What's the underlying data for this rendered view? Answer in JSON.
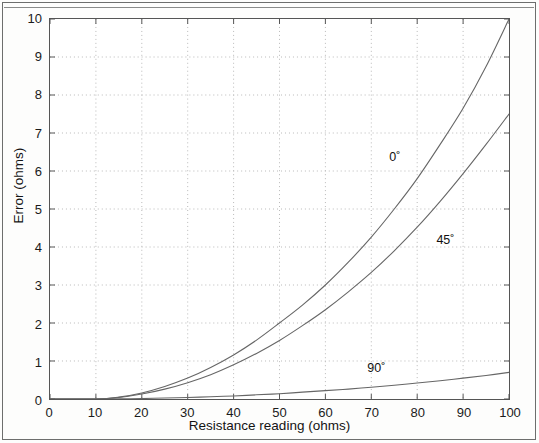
{
  "figure": {
    "xaxis_title": "Resistance reading (ohms)",
    "yaxis_title": "Error (ohms)"
  },
  "axes": {
    "y_ticks": [
      "10",
      "9",
      "8",
      "7",
      "6",
      "5",
      "4",
      "3",
      "2",
      "1",
      "0"
    ],
    "x_ticks": [
      "0",
      "10",
      "20",
      "30",
      "40",
      "50",
      "60",
      "70",
      "80",
      "90",
      "100"
    ]
  },
  "annotations": {
    "series0": "0˚",
    "series45": "45˚",
    "series90": "90˚"
  },
  "colors": {
    "curve": "#666666",
    "grid": "#b8b8b8",
    "axis": "#555555",
    "frame": "#6d6e6d",
    "text": "#141414",
    "background": "#ffffff"
  },
  "chart_data": {
    "type": "line",
    "title": "",
    "xlabel": "Resistance reading (ohms)",
    "ylabel": "Error (ohms)",
    "xlim": [
      0,
      100
    ],
    "ylim": [
      0,
      10
    ],
    "xticks": [
      0,
      10,
      20,
      30,
      40,
      50,
      60,
      70,
      80,
      90,
      100
    ],
    "yticks": [
      0,
      1,
      2,
      3,
      4,
      5,
      6,
      7,
      8,
      9,
      10
    ],
    "grid": true,
    "grid_style": "dotted",
    "legend": "inline-annotations",
    "x": [
      10,
      15,
      20,
      25,
      30,
      35,
      40,
      45,
      50,
      55,
      60,
      65,
      70,
      75,
      80,
      85,
      90,
      95,
      100
    ],
    "series": [
      {
        "name": "0˚",
        "label": "0˚",
        "label_x": 75,
        "label_y": 6.35,
        "values": [
          0,
          0.05,
          0.16,
          0.33,
          0.55,
          0.83,
          1.16,
          1.55,
          2.0,
          2.47,
          3.0,
          3.6,
          4.26,
          5.0,
          5.8,
          6.7,
          7.65,
          8.75,
          10.0
        ]
      },
      {
        "name": "45˚",
        "label": "45˚",
        "label_x": 86,
        "label_y": 4.2,
        "values": [
          0,
          0.04,
          0.13,
          0.26,
          0.43,
          0.64,
          0.9,
          1.2,
          1.54,
          1.93,
          2.35,
          2.82,
          3.33,
          3.9,
          4.52,
          5.2,
          5.93,
          6.7,
          7.5
        ]
      },
      {
        "name": "90˚",
        "label": "90˚",
        "label_x": 71,
        "label_y": 0.85,
        "values": [
          0,
          0.004,
          0.012,
          0.025,
          0.04,
          0.06,
          0.08,
          0.11,
          0.14,
          0.18,
          0.22,
          0.26,
          0.31,
          0.36,
          0.42,
          0.48,
          0.55,
          0.62,
          0.7
        ]
      }
    ]
  }
}
